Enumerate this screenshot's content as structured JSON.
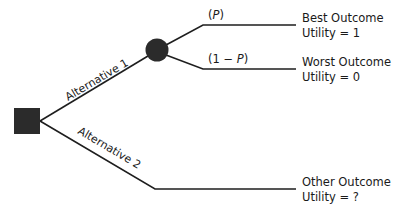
{
  "diagram": {
    "type": "decision-tree",
    "decision_node": {
      "shape": "square",
      "color": "#2b2b2b"
    },
    "chance_node": {
      "shape": "circle",
      "color": "#2b2b2b"
    },
    "alternatives": [
      {
        "label": "Alternative 1",
        "leads_to": "chance-node",
        "branches": [
          {
            "probability_open": "(",
            "probability_var": "P",
            "probability_close": ")",
            "outcome": "Best Outcome",
            "utility": "Utility = 1"
          },
          {
            "probability_open": "(1 − ",
            "probability_var": "P",
            "probability_close": ")",
            "outcome": "Worst Outcome",
            "utility": "Utility = 0"
          }
        ]
      },
      {
        "label": "Alternative 2",
        "outcome": "Other Outcome",
        "utility": "Utility = ?"
      }
    ]
  }
}
